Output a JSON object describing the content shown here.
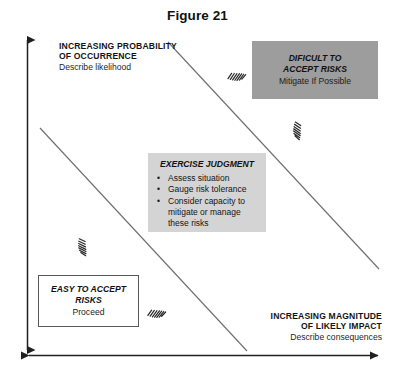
{
  "figure": {
    "title": "Figure 21"
  },
  "axes": {
    "y": {
      "line1": "INCREASING PROBABILITY",
      "line2": "OF OCCURRENCE",
      "description": "Describe likelihood"
    },
    "x": {
      "line1": "INCREASING MAGNITUDE",
      "line2": "OF LIKELY IMPACT",
      "description": "Describe consequences"
    }
  },
  "zones": {
    "difficult": {
      "title_line1": "DIFICULT TO",
      "title_line2": "ACCEPT RISKS",
      "action": "Mitigate If Possible",
      "fill": "#9d9d9d"
    },
    "judgment": {
      "title": "EXERCISE JUDGMENT",
      "bullet_glyph": "•",
      "items": [
        "Assess situation",
        "Gauge risk tolerance",
        "Consider capacity to",
        "mitigate or manage",
        "these risks"
      ],
      "fill": "#d4d4d4"
    },
    "easy": {
      "title_line1": "EASY TO ACCEPT",
      "title_line2": "RISKS",
      "action": "Proceed",
      "fill": "#ffffff"
    }
  },
  "annotations": {
    "scribbles": [
      {
        "name": "scribble-upper-left-of-difficult",
        "x": 236,
        "y": 74,
        "rotate": -18
      },
      {
        "name": "scribble-below-difficult",
        "x": 300,
        "y": 130,
        "rotate": 72
      },
      {
        "name": "scribble-mid-left",
        "x": 85,
        "y": 246,
        "rotate": 64
      },
      {
        "name": "scribble-lower-center",
        "x": 156,
        "y": 311,
        "rotate": -16
      }
    ]
  },
  "colors": {
    "axis_line": "#231f20",
    "diagonal_line": "#6f7072",
    "box_border": "#58585a",
    "background": "#ffffff"
  }
}
